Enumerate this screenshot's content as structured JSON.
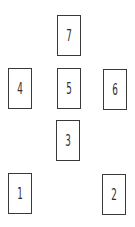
{
  "spread": {
    "background": "#ffffff",
    "card_border_color": "#3a3a3a",
    "number_color": "#2e2e2e",
    "cards": [
      {
        "position": 7,
        "label": "7"
      },
      {
        "position": 4,
        "label": "4"
      },
      {
        "position": 5,
        "label": "5"
      },
      {
        "position": 6,
        "label": "6"
      },
      {
        "position": 3,
        "label": "3"
      },
      {
        "position": 1,
        "label": "1"
      },
      {
        "position": 2,
        "label": "2"
      }
    ]
  }
}
